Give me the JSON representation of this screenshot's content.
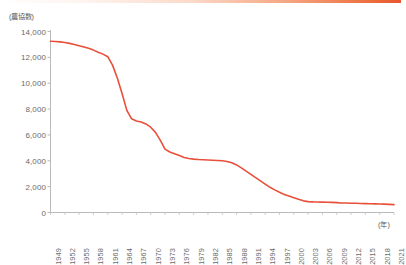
{
  "chart_data": {
    "type": "line",
    "title": "",
    "subtitle": "",
    "ylabel": "(農協数)",
    "xlabel": "(年)",
    "ylim": [
      0,
      14000
    ],
    "ytick_values": [
      0,
      2000,
      4000,
      6000,
      8000,
      10000,
      12000,
      14000
    ],
    "ytick_labels": [
      "0",
      "2,000",
      "4,000",
      "6,000",
      "8,000",
      "10,000",
      "12,000",
      "14,000"
    ],
    "xlim": [
      1949,
      2021
    ],
    "xtick_labels": [
      "1949",
      "1952",
      "1955",
      "1958",
      "1961",
      "1964",
      "1967",
      "1970",
      "1973",
      "1976",
      "1979",
      "1982",
      "1985",
      "1988",
      "1991",
      "1994",
      "1997",
      "2000",
      "2003",
      "2006",
      "2009",
      "2012",
      "2015",
      "2018",
      "2021"
    ],
    "grid": false,
    "legend": false,
    "line_color": "#e8503a",
    "line_width": 1.6,
    "markers": false,
    "series": [
      {
        "name": "農協数",
        "x": [
          1949,
          1950,
          1951,
          1952,
          1953,
          1954,
          1955,
          1956,
          1957,
          1958,
          1959,
          1960,
          1961,
          1962,
          1963,
          1964,
          1965,
          1966,
          1967,
          1968,
          1969,
          1970,
          1971,
          1972,
          1973,
          1974,
          1975,
          1976,
          1977,
          1978,
          1979,
          1980,
          1981,
          1982,
          1983,
          1984,
          1985,
          1986,
          1987,
          1988,
          1989,
          1990,
          1991,
          1992,
          1993,
          1994,
          1995,
          1996,
          1997,
          1998,
          1999,
          2000,
          2001,
          2002,
          2003,
          2004,
          2005,
          2006,
          2007,
          2008,
          2009,
          2010,
          2011,
          2012,
          2013,
          2014,
          2015,
          2016,
          2017,
          2018,
          2019,
          2020,
          2021
        ],
        "values": [
          13250,
          13230,
          13200,
          13150,
          13080,
          13000,
          12900,
          12800,
          12700,
          12560,
          12400,
          12250,
          12050,
          11400,
          10400,
          9200,
          7900,
          7250,
          7080,
          7000,
          6850,
          6600,
          6200,
          5600,
          4900,
          4680,
          4550,
          4400,
          4250,
          4180,
          4130,
          4100,
          4080,
          4060,
          4040,
          4020,
          4000,
          3950,
          3850,
          3680,
          3450,
          3200,
          2950,
          2700,
          2450,
          2200,
          1950,
          1750,
          1560,
          1400,
          1280,
          1150,
          1020,
          900,
          840,
          820,
          810,
          800,
          790,
          780,
          760,
          740,
          730,
          720,
          710,
          700,
          690,
          680,
          670,
          660,
          650,
          630,
          610
        ]
      }
    ]
  },
  "axis": {
    "unit_y": "(農協数)",
    "unit_x": "(年)"
  }
}
